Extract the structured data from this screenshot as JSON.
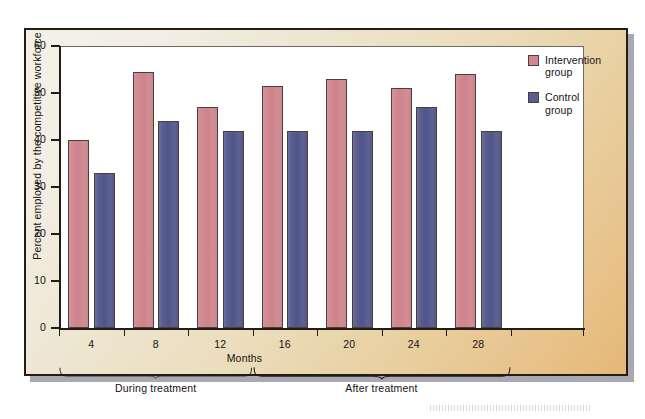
{
  "figure": {
    "background_colors": {
      "panel_light": "#f4f1e7",
      "panel_dark": "#e5b776",
      "frame": "#241d17",
      "plot_background": "#ffffff",
      "axis": "#211c17"
    }
  },
  "chart_data": {
    "type": "bar",
    "title": "",
    "xlabel": "Months",
    "ylabel": "Percent employed by the competitive workforce",
    "categories": [
      "4",
      "8",
      "12",
      "16",
      "20",
      "24",
      "28"
    ],
    "series": [
      {
        "name": "Intervention group",
        "color": "#d4868f",
        "values": [
          40,
          54.5,
          47,
          51.5,
          53,
          51,
          54
        ]
      },
      {
        "name": "Control group",
        "color": "#585e91",
        "values": [
          33,
          44,
          42,
          42,
          42,
          47,
          42
        ]
      }
    ],
    "ylim": [
      0,
      60
    ],
    "yticks": [
      0,
      10,
      20,
      30,
      40,
      50,
      60
    ],
    "ytick_labels": [
      "0",
      "10",
      "20",
      "30",
      "40",
      "50",
      "60"
    ],
    "xtick_labels": [
      "4",
      "8",
      "12",
      "16",
      "20",
      "24",
      "28"
    ],
    "grid": false,
    "legend_position": "right",
    "annotations": [
      {
        "label": "During treatment",
        "spans_categories": [
          "4",
          "8",
          "12"
        ]
      },
      {
        "label": "After treatment",
        "spans_categories": [
          "16",
          "20",
          "24",
          "28"
        ]
      }
    ]
  },
  "legend": {
    "entries": [
      {
        "label_line1": "Intervention",
        "label_line2": "group"
      },
      {
        "label_line1": "Control",
        "label_line2": "group"
      }
    ]
  },
  "annotations": {
    "during_treatment": "During treatment",
    "after_treatment": "After treatment"
  }
}
